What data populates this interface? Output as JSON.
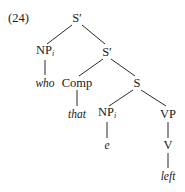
{
  "example_number": "(24)",
  "tree": {
    "root": {
      "label": "S′",
      "x": 77,
      "y": 18
    },
    "np_wh": {
      "label": "NP",
      "index": "i",
      "x": 45,
      "y": 52
    },
    "who": {
      "label": "who",
      "x": 45,
      "y": 83
    },
    "sbar2": {
      "label": "S′",
      "x": 107,
      "y": 52
    },
    "comp": {
      "label": "Comp",
      "x": 77,
      "y": 83
    },
    "that": {
      "label": "that",
      "x": 77,
      "y": 114
    },
    "s": {
      "label": "S",
      "x": 137,
      "y": 83
    },
    "np_trace": {
      "label": "NP",
      "index": "i",
      "x": 107,
      "y": 114
    },
    "e": {
      "label": "e",
      "x": 107,
      "y": 145
    },
    "vp": {
      "label": "VP",
      "x": 168,
      "y": 114
    },
    "v": {
      "label": "V",
      "x": 168,
      "y": 145
    },
    "left": {
      "label": "left",
      "x": 168,
      "y": 176
    }
  },
  "edges": [
    [
      "root",
      "np_wh"
    ],
    [
      "root",
      "sbar2"
    ],
    [
      "np_wh",
      "who"
    ],
    [
      "sbar2",
      "comp"
    ],
    [
      "sbar2",
      "s"
    ],
    [
      "comp",
      "that"
    ],
    [
      "s",
      "np_trace"
    ],
    [
      "s",
      "vp"
    ],
    [
      "np_trace",
      "e"
    ],
    [
      "vp",
      "v"
    ],
    [
      "v",
      "left"
    ]
  ]
}
